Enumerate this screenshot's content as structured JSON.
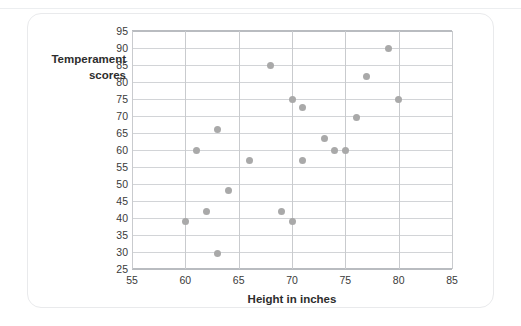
{
  "figure": {
    "card_border_color": "#e9eaec",
    "background_color": "#ffffff"
  },
  "chart_data": {
    "type": "scatter",
    "title": "",
    "xlabel": "Height in inches",
    "ylabel": "Temperament scores",
    "ylabel_lines": [
      "Temperament",
      "scores"
    ],
    "xlim": [
      55,
      85
    ],
    "ylim": [
      25,
      95
    ],
    "xticks": [
      55,
      60,
      65,
      70,
      75,
      80,
      85
    ],
    "yticks": [
      25,
      30,
      35,
      40,
      45,
      50,
      55,
      60,
      65,
      70,
      75,
      80,
      85,
      90,
      95
    ],
    "xtick_labels": [
      "55",
      "60",
      "65",
      "70",
      "75",
      "80",
      "85"
    ],
    "ytick_labels": [
      "95",
      "90",
      "85",
      "80",
      "75",
      "70",
      "65",
      "60",
      "55",
      "50",
      "45",
      "40",
      "35",
      "30",
      "25"
    ],
    "grid": {
      "horizontal": true,
      "vertical": true,
      "horizontal_color": "#d2d4d7",
      "vertical_color": "#c9cbce"
    },
    "legend": null,
    "marker": {
      "shape": "circle",
      "color": "#a9a9a9",
      "size_px": 7
    },
    "x": [
      60,
      61,
      62,
      63,
      63,
      64,
      66,
      68,
      69,
      70,
      70,
      71,
      71,
      73,
      74,
      75,
      76,
      77,
      79,
      80
    ],
    "y": [
      39,
      60,
      42,
      29.5,
      66,
      48,
      57,
      85,
      42,
      39,
      75,
      57,
      72.5,
      63.5,
      60,
      60,
      69.5,
      81.5,
      90,
      75
    ],
    "points": [
      {
        "x": 60,
        "y": 39
      },
      {
        "x": 61,
        "y": 60
      },
      {
        "x": 62,
        "y": 42
      },
      {
        "x": 63,
        "y": 29.5
      },
      {
        "x": 63,
        "y": 66
      },
      {
        "x": 64,
        "y": 48
      },
      {
        "x": 66,
        "y": 57
      },
      {
        "x": 68,
        "y": 85
      },
      {
        "x": 69,
        "y": 42
      },
      {
        "x": 70,
        "y": 39
      },
      {
        "x": 70,
        "y": 75
      },
      {
        "x": 71,
        "y": 57
      },
      {
        "x": 71,
        "y": 72.5
      },
      {
        "x": 73,
        "y": 63.5
      },
      {
        "x": 74,
        "y": 60
      },
      {
        "x": 75,
        "y": 60
      },
      {
        "x": 76,
        "y": 69.5
      },
      {
        "x": 77,
        "y": 81.5
      },
      {
        "x": 79,
        "y": 90
      },
      {
        "x": 80,
        "y": 75
      }
    ]
  }
}
